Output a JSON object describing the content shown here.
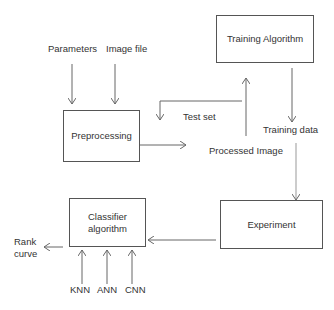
{
  "nodes": {
    "training_algorithm": "Training Algorithm",
    "preprocessing": "Preprocessing",
    "experiment": "Experiment",
    "classifier_line1": "Classifier",
    "classifier_line2": "algorithm"
  },
  "labels": {
    "parameters": "Parameters",
    "image_file": "Image file",
    "test_set": "Test set",
    "training_data": "Training data",
    "processed_image": "Processed Image",
    "rank": "Rank",
    "curve": "curve",
    "knn": "KNN",
    "ann": "ANN",
    "cnn": "CNN"
  },
  "colors": {
    "line": "#666666",
    "box_border": "#555555",
    "text": "#333333"
  }
}
